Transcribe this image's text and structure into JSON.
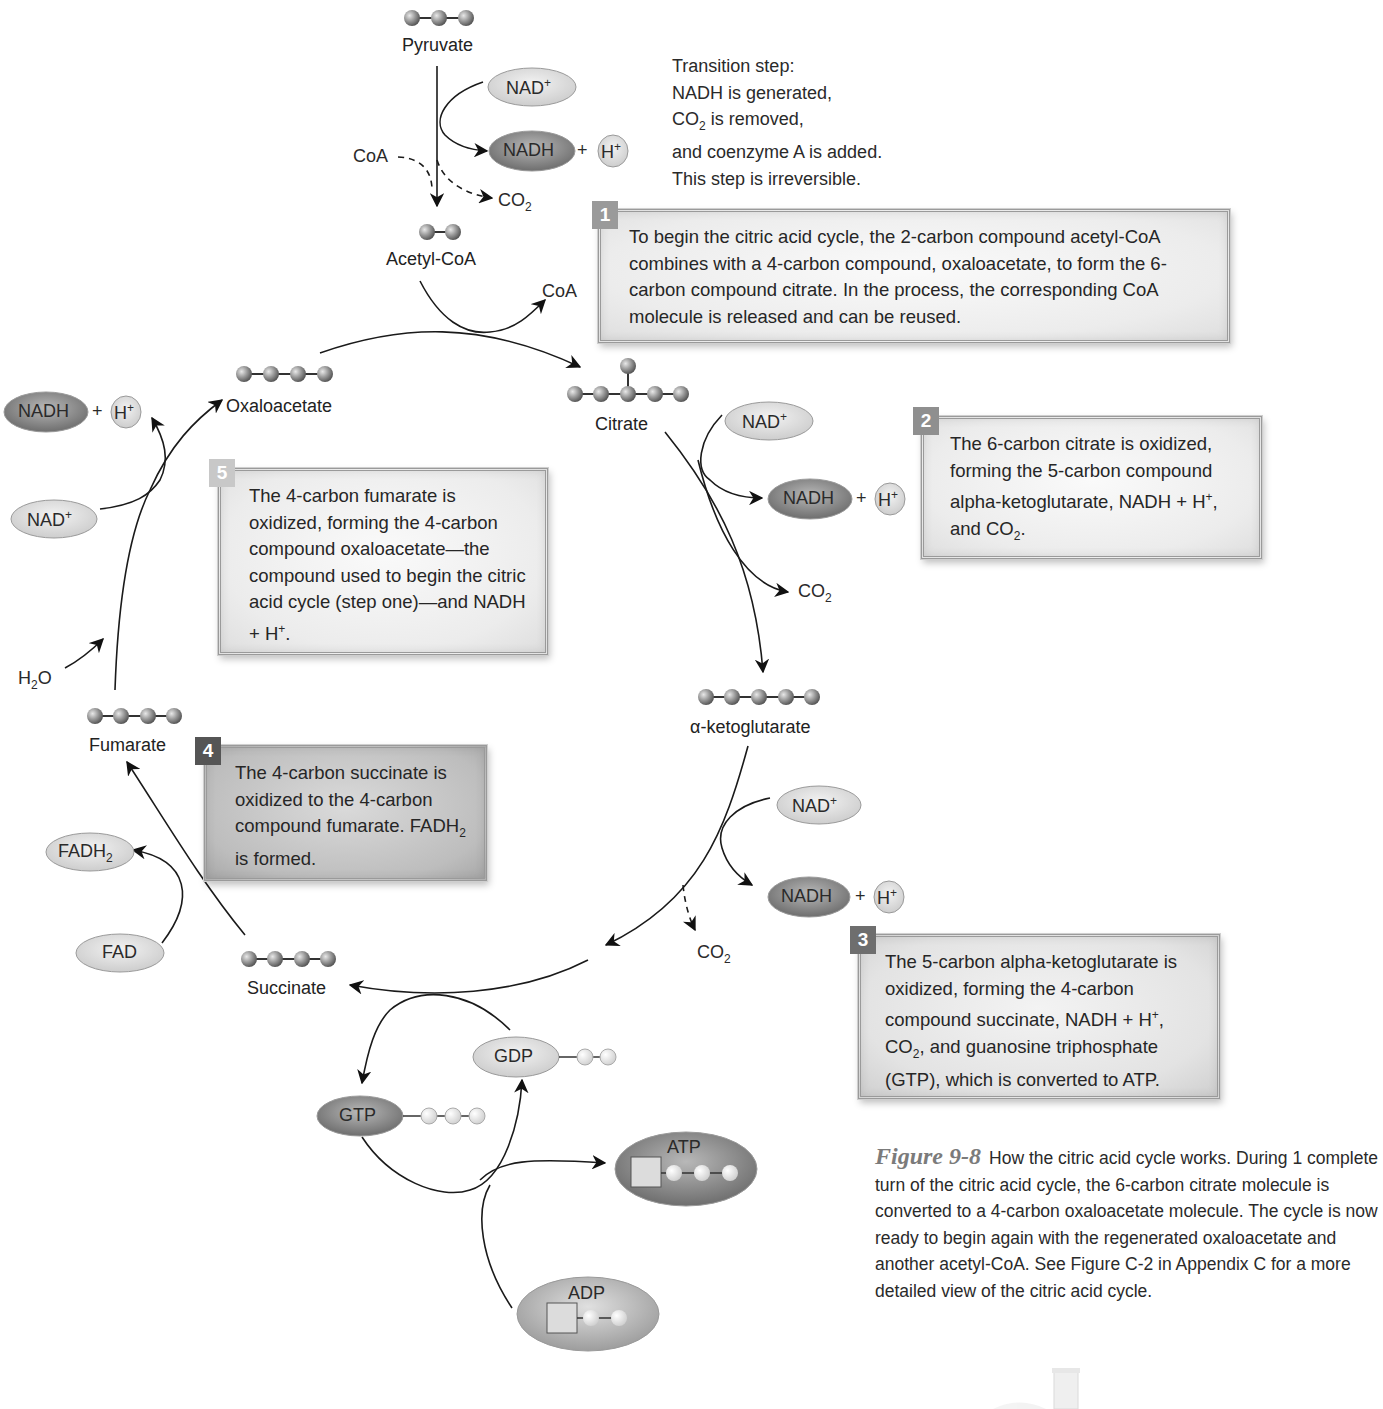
{
  "figure": {
    "number": "Figure 9-8",
    "caption": "How the citric acid cycle works. During 1 complete turn of the citric acid cycle, the 6-carbon citrate molecule is converted to a 4-carbon oxaloacetate molecule. The cycle is now ready to begin again with the regenerated oxaloacetate and another acetyl-CoA. See Figure C-2 in Appendix C for a more detailed view of the citric acid cycle."
  },
  "transition_step": {
    "lines": [
      "Transition step:",
      "NADH is generated,",
      "CO2 is removed,",
      "and coenzyme A is added.",
      "This step is irreversible."
    ]
  },
  "molecules": {
    "pyruvate": {
      "label": "Pyruvate",
      "carbons": 3
    },
    "acetyl_coa": {
      "label": "Acetyl-CoA",
      "carbons": 2
    },
    "citrate": {
      "label": "Citrate",
      "carbons": 6
    },
    "alpha_ketoglutarate": {
      "label": "α-ketoglutarate",
      "carbons": 5
    },
    "succinate": {
      "label": "Succinate",
      "carbons": 4
    },
    "fumarate": {
      "label": "Fumarate",
      "carbons": 4
    },
    "oxaloacetate": {
      "label": "Oxaloacetate",
      "carbons": 4
    }
  },
  "cofactors": {
    "nad_plus": "NAD",
    "plus_sign": "+",
    "nadh": "NADH",
    "h_plus": "H",
    "plus_sup": "+",
    "co2": "CO",
    "co2_sub": "2",
    "coa": "CoA",
    "h2o_h": "H",
    "h2o_sub": "2",
    "h2o_o": "O",
    "fad": "FAD",
    "fadh2": "FADH",
    "fadh2_sub": "2",
    "gdp": "GDP",
    "gtp": "GTP",
    "atp": "ATP",
    "adp": "ADP"
  },
  "steps": [
    {
      "number": "1",
      "text": "To begin the citric acid cycle, the 2-carbon compound acetyl-CoA combines with a 4-carbon compound, oxaloacetate, to form the 6-carbon compound citrate. In the process, the corresponding CoA molecule is released and can be reused.",
      "badge_color": "#9a9a9a"
    },
    {
      "number": "2",
      "text_a": "The 6-carbon citrate is oxidized, forming the 5-carbon compound alpha-ketoglutarate, NADH + H",
      "text_b": ", and CO",
      "text_c": ".",
      "badge_color": "#8f8f8f"
    },
    {
      "number": "3",
      "text_a": "The 5-carbon alpha-ketoglutarate is oxidized, forming the 4-carbon compound succinate, NADH + H",
      "text_b": ", CO",
      "text_c": ", and guanosine triphosphate (GTP), which is converted to ATP.",
      "badge_color": "#6e6e6e"
    },
    {
      "number": "4",
      "text_a": "The 4-carbon succinate is oxidized to the 4-carbon compound fumarate. FADH",
      "text_b": " is formed.",
      "badge_color": "#555555"
    },
    {
      "number": "5",
      "text_a": "The 4-carbon fumarate is oxidized, forming the 4-carbon compound oxaloacetate—the compound used to begin the citric acid cycle (step one)—and NADH + H",
      "text_b": ".",
      "badge_color": "#c8c8c8"
    }
  ]
}
